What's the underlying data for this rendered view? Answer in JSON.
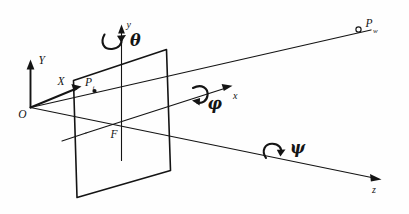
{
  "figure": {
    "kind": "line-diagram",
    "background_color": "#fefefe",
    "ink_color": "#141414",
    "width": 409,
    "height": 214
  },
  "labels": {
    "origin": "O",
    "world_y_axis": "Y",
    "world_x_axis": "X",
    "camera_y_axis": "y",
    "camera_x_axis": "x",
    "camera_z_axis": "z",
    "focal_point": "F",
    "image_point": "P",
    "image_point_sub": "i",
    "world_point": "P",
    "world_point_sub": "w"
  },
  "rotations": [
    {
      "name": "theta-rotation",
      "symbol": "θ",
      "about_axis": "y",
      "icon": "curved-arrow-icon"
    },
    {
      "name": "phi-rotation",
      "symbol": "φ",
      "about_axis": "x",
      "icon": "curved-arrow-icon"
    },
    {
      "name": "psi-rotation",
      "symbol": "ψ",
      "about_axis": "z",
      "icon": "curved-arrow-icon"
    }
  ],
  "points": [
    {
      "name": "origin-point",
      "label": "O",
      "marker": "none"
    },
    {
      "name": "image-point",
      "label": "P",
      "marker": "filled-dot"
    },
    {
      "name": "world-point",
      "label": "P",
      "marker": "open-dot"
    },
    {
      "name": "focal-point",
      "label": "F",
      "marker": "none"
    }
  ],
  "elements": {
    "image_plane_name": "image-plane",
    "projection_ray_name": "projection-ray",
    "optical_axis_name": "optical-axis"
  }
}
